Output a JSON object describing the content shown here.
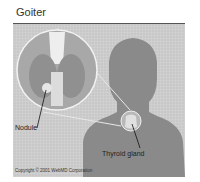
{
  "title": "Goiter",
  "figure": {
    "labels": {
      "nodule": "Nodule",
      "thyroid": "Thyroid gland"
    },
    "copyright": "Copyright © 2001 WebMD Corporation"
  }
}
